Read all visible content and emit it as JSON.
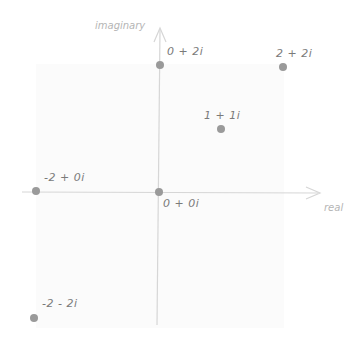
{
  "diagram": {
    "type": "complex-plane",
    "axes": {
      "x_label": "real",
      "y_label": "imaginary",
      "axis_color": "#d6d6d6"
    },
    "point_color": "#9a9a9a",
    "points": [
      {
        "label": "0 + 2i",
        "re": 0,
        "im": 2
      },
      {
        "label": "2 + 2i",
        "re": 2,
        "im": 2
      },
      {
        "label": "1 + 1i",
        "re": 1,
        "im": 1
      },
      {
        "label": "-2 + 0i",
        "re": -2,
        "im": 0
      },
      {
        "label": "0 + 0i",
        "re": 0,
        "im": 0
      },
      {
        "label": "-2 - 2i",
        "re": -2,
        "im": -2
      }
    ]
  }
}
